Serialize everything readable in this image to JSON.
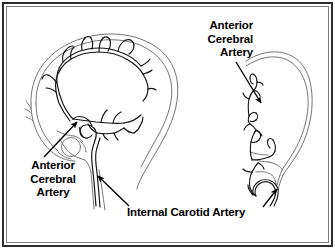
{
  "figure": {
    "kind": "anatomical-illustration",
    "background_color": "#ffffff",
    "ink_color": "#000000",
    "frame": {
      "outer_border_color": "#2e2e2e",
      "inner_border_color": "#7d7d7d"
    }
  },
  "panels": [
    {
      "id": "lateral-view",
      "name": "Lateral skull and cerebral arteries",
      "projection": "lateral",
      "facing": "right",
      "structures": [
        "skull outline",
        "anterior cerebral artery",
        "pericallosal branches",
        "middle cerebral artery branches",
        "carotid siphon",
        "internal carotid artery",
        "sella turcica region"
      ]
    },
    {
      "id": "ap-view",
      "name": "Anteroposterior skull and cerebral arteries",
      "projection": "anteroposterior",
      "facing": "right",
      "structures": [
        "skull outline",
        "anterior cerebral artery",
        "midline branches",
        "carotid siphon",
        "internal carotid artery"
      ]
    }
  ],
  "labels": {
    "aca_top": {
      "lines": [
        "Anterior",
        "Cerebral",
        "Artery"
      ],
      "align": "right",
      "points_to": "anterior cerebral artery (AP view)"
    },
    "aca_left": {
      "lines": [
        "Anterior",
        "Cerebral",
        "Artery"
      ],
      "align": "center",
      "points_to": "anterior cerebral artery (lateral view)"
    },
    "internal_carotid": {
      "text": "Internal Carotid Artery",
      "align": "left",
      "points_to": "internal carotid artery (both views)"
    }
  },
  "leaders": [
    {
      "name": "leader-aca-top",
      "from": [
        236,
        62
      ],
      "to": [
        262,
        104
      ],
      "arrowhead": "to"
    },
    {
      "name": "leader-aca-left",
      "from": [
        44,
        157
      ],
      "to": [
        78,
        122
      ],
      "arrowhead": "to"
    },
    {
      "name": "leader-ica-left",
      "from": [
        128,
        207
      ],
      "to": [
        97,
        176
      ],
      "arrowhead": "to"
    },
    {
      "name": "leader-ica-right",
      "from": [
        263,
        207
      ],
      "to": [
        278,
        188
      ],
      "arrowhead": "to"
    }
  ]
}
